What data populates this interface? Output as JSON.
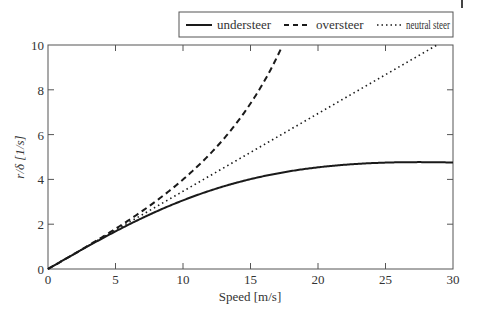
{
  "chart_data": {
    "type": "line",
    "title": "",
    "xlabel": "Speed [m/s]",
    "ylabel": "r/δ [1/s]",
    "xlim": [
      0,
      30
    ],
    "ylim": [
      0,
      10
    ],
    "xticks": [
      0,
      5,
      10,
      15,
      20,
      25,
      30
    ],
    "yticks": [
      0,
      2,
      4,
      6,
      8,
      10
    ],
    "grid": false,
    "legend_position": "top-right, above plot",
    "x": [
      0,
      2.5,
      5,
      7.5,
      10,
      12.5,
      15,
      17.5,
      20,
      22.5,
      25,
      27.5,
      30
    ],
    "series": [
      {
        "name": "understeer",
        "style": "solid",
        "values": [
          0,
          0.86,
          1.68,
          2.42,
          3.07,
          3.6,
          4.03,
          4.35,
          4.57,
          4.71,
          4.77,
          4.77,
          4.75
        ]
      },
      {
        "name": "oversteer",
        "style": "dashed",
        "values": [
          0,
          0.87,
          1.79,
          2.81,
          4.0,
          5.46,
          7.36,
          10.0,
          null,
          null,
          null,
          null,
          null
        ]
      },
      {
        "name": "neutral steer",
        "style": "dotted",
        "values": [
          0,
          0.87,
          1.74,
          2.6,
          3.47,
          4.34,
          5.21,
          6.07,
          6.94,
          7.81,
          8.68,
          9.55,
          10.0
        ]
      }
    ]
  },
  "legend": {
    "items": [
      {
        "label": "understeer",
        "style": "solid"
      },
      {
        "label": "oversteer",
        "style": "dashed"
      },
      {
        "label": "neutral steer",
        "style": "dotted"
      }
    ]
  },
  "axes": {
    "xlabel": "Speed [m/s]",
    "ylabel": "r/δ [1/s]",
    "xtick_labels": [
      "0",
      "5",
      "10",
      "15",
      "20",
      "25",
      "30"
    ],
    "ytick_labels": [
      "0",
      "2",
      "4",
      "6",
      "8",
      "10"
    ]
  },
  "colors": {
    "line": "#1a1a1a",
    "axis": "#444444",
    "text": "#333333"
  }
}
